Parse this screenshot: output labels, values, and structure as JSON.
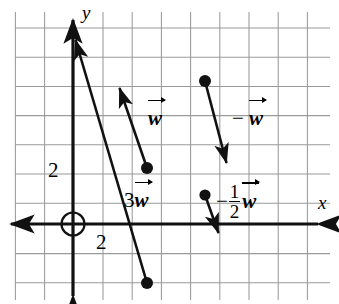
{
  "figure": {
    "background_color": "#ffffff",
    "grid_color": "#9a9a9a",
    "axis_color": "#111111",
    "vector_color": "#111111",
    "width": 339,
    "height": 304
  },
  "axes": {
    "x_label": "x",
    "y_label": "y",
    "x_tick_label": "2",
    "y_tick_label": "2",
    "origin_marker": "origin-circle",
    "grid_spacing_px": 29.2,
    "origin_px": {
      "x": 73,
      "y": 224
    }
  },
  "vectors": [
    {
      "name": "w",
      "label_coefficient": "",
      "label_symbol": "w",
      "label_text": "w",
      "tail": {
        "x": 147,
        "y": 168
      },
      "head": {
        "x": 118,
        "y": 82
      },
      "components": {
        "x": -1,
        "y": 3
      },
      "label_px": {
        "x": 150,
        "y": 119
      }
    },
    {
      "name": "3w",
      "label_coefficient": "3",
      "label_symbol": "w",
      "label_text": "3w",
      "tail": {
        "x": 147,
        "y": 283
      },
      "head": {
        "x": 73,
        "y": 34
      },
      "components": {
        "x": -3,
        "y": 9
      },
      "label_px": {
        "x": 128,
        "y": 200
      }
    },
    {
      "name": "-w",
      "label_coefficient": "−",
      "label_symbol": "w",
      "label_text": "− w",
      "tail": {
        "x": 205,
        "y": 81
      },
      "head": {
        "x": 228,
        "y": 169
      },
      "components": {
        "x": 1,
        "y": -3
      },
      "label_px": {
        "x": 236,
        "y": 119
      }
    },
    {
      "name": "-1/2 w",
      "label_coefficient": "− 1/2",
      "label_symbol": "w",
      "label_text": "− 1/2 w",
      "fraction_numerator": "1",
      "fraction_denominator": "2",
      "tail": {
        "x": 205,
        "y": 195
      },
      "head": {
        "x": 220,
        "y": 238
      },
      "components": {
        "x": 0.5,
        "y": -1.5
      },
      "label_px": {
        "x": 224,
        "y": 184
      }
    }
  ]
}
